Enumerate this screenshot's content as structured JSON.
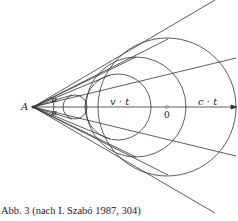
{
  "diagram": {
    "labels": {
      "point_a": "A",
      "alpha_top": "α",
      "alpha_bottom": "α",
      "v_t": "v · t",
      "origin": "0",
      "c_t": "c · t"
    },
    "caption": "Abb. 3 (nach I. Szabó 1987, 304)",
    "colors": {
      "stroke": "#333333",
      "background": "#ffffff"
    }
  }
}
